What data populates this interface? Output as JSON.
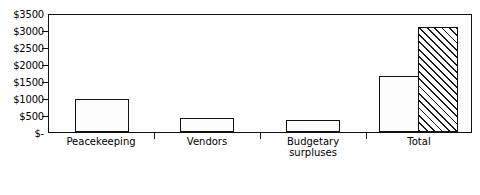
{
  "chart_data": {
    "type": "bar",
    "title": "",
    "subtitle": "",
    "xlabel": "",
    "ylabel": "",
    "categories": [
      "Peacekeeping",
      "Vendors",
      "Budgetary\nsurpluses",
      "Total"
    ],
    "ylim": [
      0,
      3500
    ],
    "ytick_values": [
      0,
      500,
      1000,
      1500,
      2000,
      2500,
      3000,
      3500
    ],
    "ytick_labels": [
      "$-",
      "$500",
      "$1000",
      "$1500",
      "$2000",
      "$2500",
      "$3000",
      "$3500"
    ],
    "grid": false,
    "legend": "none",
    "series": [
      {
        "name": "Amount owed",
        "fill": "dotted",
        "values": [
          1000,
          430,
          370,
          1690
        ]
      },
      {
        "name": "Total",
        "fill": "diagonal-hatch",
        "values": [
          null,
          null,
          null,
          3150
        ]
      }
    ],
    "bar_fill_colors": {
      "dotted": "#fdfdfd",
      "hatch": "#ffffff",
      "outline": "#111111"
    }
  },
  "axis": {
    "frame_color": "#111111"
  }
}
